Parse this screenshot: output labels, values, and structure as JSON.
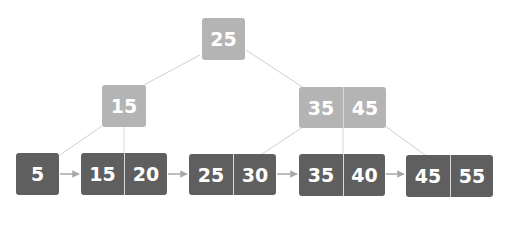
{
  "diagram": {
    "type": "B+ tree",
    "colors": {
      "internal_node": "#b4b4b4",
      "leaf_node": "#5f5f5f",
      "key_text": "#ffffff",
      "edge": "#cfcfcf",
      "leaf_link_arrow": "#a8a8a8"
    },
    "root": {
      "keys": [
        "25"
      ]
    },
    "internal": [
      {
        "keys": [
          "15"
        ]
      },
      {
        "keys": [
          "35",
          "45"
        ]
      }
    ],
    "leaves": [
      {
        "keys": [
          "5"
        ]
      },
      {
        "keys": [
          "15",
          "20"
        ]
      },
      {
        "keys": [
          "25",
          "30"
        ]
      },
      {
        "keys": [
          "35",
          "40"
        ]
      },
      {
        "keys": [
          "45",
          "55"
        ]
      }
    ],
    "edges": [
      {
        "from": "root",
        "to": "internal.0"
      },
      {
        "from": "root",
        "to": "internal.1"
      },
      {
        "from": "internal.0",
        "to": "leaves.0"
      },
      {
        "from": "internal.0",
        "to": "leaves.1"
      },
      {
        "from": "internal.1",
        "to": "leaves.2"
      },
      {
        "from": "internal.1",
        "to": "leaves.3"
      },
      {
        "from": "internal.1",
        "to": "leaves.4"
      }
    ],
    "leaf_links": [
      {
        "from": "leaves.0",
        "to": "leaves.1"
      },
      {
        "from": "leaves.1",
        "to": "leaves.2"
      },
      {
        "from": "leaves.2",
        "to": "leaves.3"
      },
      {
        "from": "leaves.3",
        "to": "leaves.4"
      }
    ]
  }
}
